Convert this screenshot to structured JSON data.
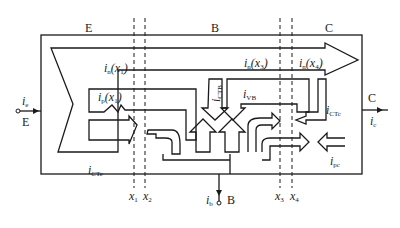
{
  "diagram": {
    "title": "",
    "regions": {
      "emitter": "E",
      "base": "B",
      "collector": "C"
    },
    "terminals": {
      "emitter": {
        "label": "E",
        "current": "i",
        "current_sub": "e"
      },
      "collector": {
        "label": "C",
        "current": "i",
        "current_sub": "c"
      },
      "base": {
        "label": "B",
        "current": "i",
        "current_sub": "b"
      }
    },
    "currents": {
      "in_x1": {
        "main": "i",
        "sub": "n",
        "arg": "(x",
        "arg_sub": "1",
        "close": ")"
      },
      "ip_x1": {
        "main": "i",
        "sub": "p",
        "arg": "(x",
        "arg_sub": "1",
        "close": ")"
      },
      "in_x3": {
        "main": "i",
        "sub": "n",
        "arg": "(x",
        "arg_sub": "3",
        "close": ")"
      },
      "in_x4": {
        "main": "i",
        "sub": "n",
        "arg": "(x",
        "arg_sub": "4",
        "close": ")"
      },
      "iCTB": {
        "main": "i",
        "sub": "CTB"
      },
      "iVB": {
        "main": "i",
        "sub": "VB"
      },
      "iCTc": {
        "main": "i",
        "sub": "CTc"
      },
      "iCTe": {
        "main": "i",
        "sub": "CTe"
      },
      "ipc": {
        "main": "i",
        "sub": "pc"
      }
    },
    "boundaries": [
      {
        "x": "x",
        "sub": "1"
      },
      {
        "x": "x",
        "sub": "2"
      },
      {
        "x": "x",
        "sub": "3"
      },
      {
        "x": "x",
        "sub": "4"
      }
    ],
    "colors": {
      "stroke": "#1a1a1a",
      "background": "#ffffff"
    }
  }
}
